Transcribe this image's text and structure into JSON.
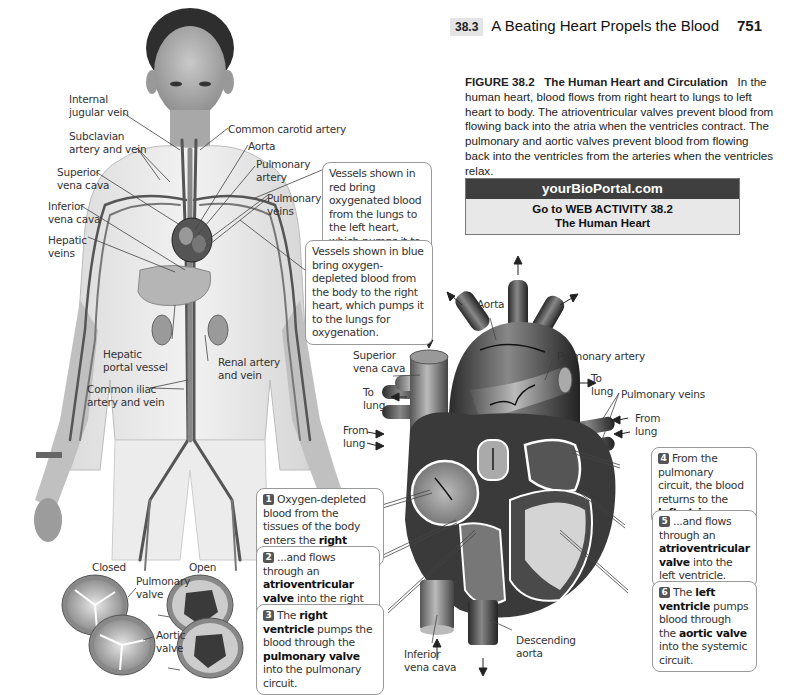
{
  "header": {
    "section_number": "38.3",
    "running_title": "A Beating Heart Propels the Blood",
    "page_number": "751"
  },
  "caption": {
    "figure_label": "FIGURE 38.2",
    "figure_title": "The Human Heart and Circulation",
    "body": "In the human heart, blood flows from right heart to lungs to left heart to body. The atrioventricular valves prevent blood from flowing back into the atria when the ventricles contract. The pulmonary and aortic valves prevent blood from flowing back into the ventricles from the arteries when the ventricles relax."
  },
  "portal": {
    "site": "yourBioPortal.com",
    "activity_line1": "Go to WEB ACTIVITY 38.2",
    "activity_line2": "The Human Heart"
  },
  "body_figure": {
    "labels": {
      "internal_jugular": "Internal\njugular vein",
      "subclavian": "Subclavian\nartery and vein",
      "superior_vena_cava": "Superior\nvena cava",
      "inferior_vena_cava": "Inferior\nvena cava",
      "hepatic_veins": "Hepatic\nveins",
      "common_carotid": "Common carotid artery",
      "aorta": "Aorta",
      "pulmonary_artery": "Pulmonary\nartery",
      "pulmonary_veins": "Pulmonary\nveins",
      "hepatic_portal": "Hepatic\nportal vessel",
      "renal": "Renal artery\nand vein",
      "common_iliac": "Common iliac\nartery and vein"
    },
    "notes": {
      "red_vessels": "Vessels shown in red bring oxygenated blood from the lungs to the left heart, which pumps it to the rest of the body.",
      "blue_vessels": "Vessels shown in blue bring oxygen-depleted blood from the body to the right heart, which pumps it to the lungs for oxygenation."
    }
  },
  "heart_figure": {
    "labels": {
      "aorta": "Aorta",
      "superior_vena_cava": "Superior\nvena cava",
      "pulmonary_artery": "Pulmonary artery",
      "to_lung_left": "To\nlung",
      "to_lung_right": "To\nlung",
      "pulmonary_veins": "Pulmonary veins",
      "from_lung_left": "From\nlung",
      "from_lung_right": "From\nlung",
      "inferior_vena_cava": "Inferior\nvena cava",
      "descending_aorta": "Descending\naorta"
    },
    "steps": [
      {
        "n": "1",
        "pre": "Oxygen-depleted blood from the tissues of the body enters the ",
        "bold": "right atrium",
        "post": "..."
      },
      {
        "n": "2",
        "pre": "...and flows through an ",
        "bold": "atrioventricular valve",
        "post": " into the right ventricle."
      },
      {
        "n": "3",
        "pre": "The ",
        "bold": "right ventricle",
        "mid": " pumps the blood through the ",
        "bold2": "pulmonary valve",
        "post": " into the pulmonary circuit."
      },
      {
        "n": "4",
        "pre": "From the pulmonary circuit, the blood returns to the ",
        "bold": "left atrium",
        "post": "..."
      },
      {
        "n": "5",
        "pre": "...and flows through an ",
        "bold": "atrioventricular valve",
        "post": " into the left ventricle."
      },
      {
        "n": "6",
        "pre": "The ",
        "bold": "left ventricle",
        "mid": " pumps blood through the ",
        "bold2": "aortic valve",
        "post": " into the systemic circuit."
      }
    ]
  },
  "valve_figure": {
    "closed_label": "Closed",
    "open_label": "Open",
    "pulmonary_label": "Pulmonary\nvalve",
    "aortic_label": "Aortic\nvalve"
  }
}
